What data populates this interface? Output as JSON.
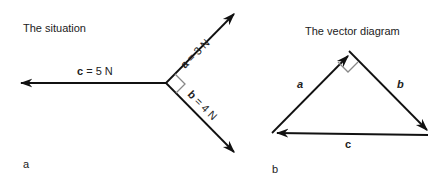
{
  "panel_a": {
    "title": "The situation",
    "label": "a",
    "vectors": {
      "a": {
        "name": "a",
        "eq": "=",
        "value": "3 N"
      },
      "b": {
        "name": "b",
        "eq": "=",
        "value": "4 N"
      },
      "c": {
        "name": "c",
        "eq": "=",
        "value": "5 N"
      }
    }
  },
  "panel_b": {
    "title": "The vector diagram",
    "label": "b",
    "sides": {
      "a": "a",
      "b": "b",
      "c": "c"
    }
  },
  "colors": {
    "line": "#111111",
    "right_angle_marker": "#888888",
    "background": "#ffffff"
  }
}
